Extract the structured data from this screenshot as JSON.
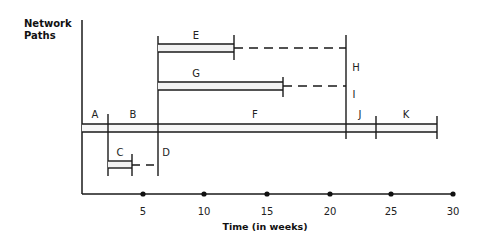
{
  "diagram": {
    "y_axis_title_line1": "Network",
    "y_axis_title_line2": "Paths",
    "x_axis_title": "Time (in weeks)",
    "x_ticks": [
      "5",
      "10",
      "15",
      "20",
      "25",
      "30"
    ],
    "activities": {
      "A": "A",
      "B": "B",
      "C": "C",
      "D": "D",
      "E": "E",
      "F": "F",
      "G": "G",
      "H": "H",
      "I": "I",
      "J": "J",
      "K": "K"
    },
    "colors": {
      "line": "#1a1a1a",
      "bar_fill": "#f2f2f2"
    }
  }
}
